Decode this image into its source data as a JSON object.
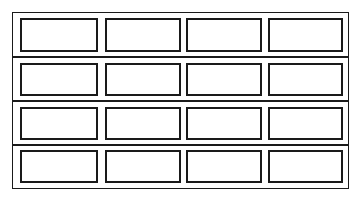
{
  "diagram": {
    "rows": 4,
    "columns": 4,
    "line_color": "#1a1a1a",
    "background": "#ffffff",
    "frame": {
      "left": 12,
      "top": 12,
      "width": 337,
      "height": 177
    },
    "row_separators_y": [
      56,
      100,
      144
    ],
    "panel_columns": [
      {
        "left": 20,
        "width": 78
      },
      {
        "left": 105,
        "width": 76
      },
      {
        "left": 186,
        "width": 76
      },
      {
        "left": 268,
        "width": 75
      }
    ],
    "panel_rows": [
      {
        "top": 18,
        "height": 34
      },
      {
        "top": 63,
        "height": 33
      },
      {
        "top": 107,
        "height": 33
      },
      {
        "top": 150,
        "height": 33
      }
    ]
  }
}
